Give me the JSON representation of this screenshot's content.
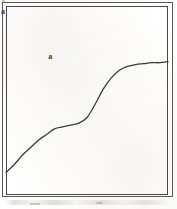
{
  "figure": {
    "kind": "line-plot-scan",
    "background_color": "#ffffff",
    "frame": {
      "outer_border_color": "#5a5a58",
      "inner_border_color": "#49494a",
      "outer_rect": [
        2,
        2,
        171,
        195
      ],
      "inner_rect": [
        6,
        6,
        162,
        189
      ]
    },
    "labels": {
      "upper_left": "a",
      "lower_right_mark": "°",
      "lower_right": "a"
    },
    "curve": {
      "color": "#3c3c3e",
      "width_px": 1.3,
      "shape": "double-sigmoid staircase, monotonically increasing"
    },
    "smudge_note": ""
  },
  "chart_data": {
    "type": "line",
    "title": "",
    "xlabel": "",
    "ylabel": "",
    "grid": false,
    "legend": null,
    "xlim": [
      0,
      1
    ],
    "ylim": [
      0,
      1
    ],
    "annotations": [
      {
        "text": "a",
        "x": 0.28,
        "y": 0.73
      },
      {
        "text": "°a",
        "x": 0.75,
        "y": 0.38
      }
    ],
    "series": [
      {
        "name": "curve",
        "x": [
          0.0,
          0.05,
          0.1,
          0.15,
          0.2,
          0.25,
          0.3,
          0.35,
          0.4,
          0.45,
          0.5,
          0.55,
          0.6,
          0.65,
          0.7,
          0.75,
          0.8,
          0.85,
          0.9,
          0.95,
          1.0
        ],
        "y": [
          0.12,
          0.16,
          0.21,
          0.25,
          0.29,
          0.32,
          0.35,
          0.36,
          0.37,
          0.38,
          0.41,
          0.48,
          0.56,
          0.62,
          0.66,
          0.68,
          0.69,
          0.695,
          0.7,
          0.7,
          0.705
        ]
      }
    ]
  }
}
